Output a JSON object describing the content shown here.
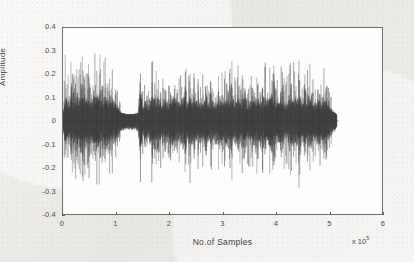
{
  "figure": {
    "name": "speech-waveform-plot",
    "background_color": "#ecebe7",
    "plot_area_color": "#fdfdfc",
    "axis_color": "#6f6f6f",
    "signal_color": "#3a3a3a"
  },
  "chart_data": {
    "type": "line",
    "title": "",
    "subtitle": "",
    "xlabel": "No.of Samples",
    "ylabel": "Amplitude",
    "x_multiplier_label": "x 10",
    "x_multiplier_exponent": "5",
    "xlim": [
      0,
      6
    ],
    "ylim": [
      -0.4,
      0.4
    ],
    "xticks": [
      0,
      1,
      2,
      3,
      4,
      5,
      6
    ],
    "xticklabels": [
      "0",
      "1",
      "2",
      "3",
      "4",
      "5",
      "6"
    ],
    "yticks": [
      0.4,
      0.3,
      0.2,
      0.1,
      0,
      -0.1,
      -0.2,
      -0.3,
      -0.4
    ],
    "yticklabels": [
      "0.4",
      "0.3",
      "0.2",
      "0.1",
      "0",
      "-0.1",
      "-0.2",
      "-0.3",
      "-0.4"
    ],
    "grid": false,
    "legend": null,
    "series_name": "audio amplitude",
    "signal_start_x": 0.0,
    "signal_end_x": 5.15,
    "max_positive_peak": 0.37,
    "max_negative_peak": -0.38,
    "noise_floor_band": 0.03,
    "envelope": [
      {
        "x": 0.0,
        "amp": 0.05
      },
      {
        "x": 0.05,
        "amp": 0.34
      },
      {
        "x": 0.1,
        "amp": 0.22
      },
      {
        "x": 0.15,
        "amp": 0.3
      },
      {
        "x": 0.2,
        "amp": 0.2
      },
      {
        "x": 0.26,
        "amp": 0.33
      },
      {
        "x": 0.32,
        "amp": 0.24
      },
      {
        "x": 0.38,
        "amp": 0.31
      },
      {
        "x": 0.44,
        "amp": 0.21
      },
      {
        "x": 0.5,
        "amp": 0.27
      },
      {
        "x": 0.56,
        "amp": 0.23
      },
      {
        "x": 0.62,
        "amp": 0.32
      },
      {
        "x": 0.68,
        "amp": 0.3
      },
      {
        "x": 0.74,
        "amp": 0.25
      },
      {
        "x": 0.8,
        "amp": 0.28
      },
      {
        "x": 0.86,
        "amp": 0.22
      },
      {
        "x": 0.92,
        "amp": 0.26
      },
      {
        "x": 0.98,
        "amp": 0.18
      },
      {
        "x": 1.04,
        "amp": 0.12
      },
      {
        "x": 1.1,
        "amp": 0.05
      },
      {
        "x": 1.18,
        "amp": 0.03
      },
      {
        "x": 1.26,
        "amp": 0.025
      },
      {
        "x": 1.34,
        "amp": 0.03
      },
      {
        "x": 1.42,
        "amp": 0.05
      },
      {
        "x": 1.45,
        "amp": 0.37
      },
      {
        "x": 1.5,
        "amp": 0.16
      },
      {
        "x": 1.56,
        "amp": 0.22
      },
      {
        "x": 1.62,
        "amp": 0.14
      },
      {
        "x": 1.68,
        "amp": 0.3
      },
      {
        "x": 1.74,
        "amp": 0.21
      },
      {
        "x": 1.8,
        "amp": 0.28
      },
      {
        "x": 1.86,
        "amp": 0.17
      },
      {
        "x": 1.92,
        "amp": 0.24
      },
      {
        "x": 1.98,
        "amp": 0.15
      },
      {
        "x": 2.04,
        "amp": 0.2
      },
      {
        "x": 2.1,
        "amp": 0.29
      },
      {
        "x": 2.16,
        "amp": 0.18
      },
      {
        "x": 2.22,
        "amp": 0.23
      },
      {
        "x": 2.28,
        "amp": 0.27
      },
      {
        "x": 2.34,
        "amp": 0.19
      },
      {
        "x": 2.4,
        "amp": 0.32
      },
      {
        "x": 2.46,
        "amp": 0.21
      },
      {
        "x": 2.52,
        "amp": 0.25
      },
      {
        "x": 2.58,
        "amp": 0.17
      },
      {
        "x": 2.64,
        "amp": 0.22
      },
      {
        "x": 2.7,
        "amp": 0.28
      },
      {
        "x": 2.76,
        "amp": 0.19
      },
      {
        "x": 2.82,
        "amp": 0.24
      },
      {
        "x": 2.88,
        "amp": 0.16
      },
      {
        "x": 2.94,
        "amp": 0.26
      },
      {
        "x": 3.0,
        "amp": 0.3
      },
      {
        "x": 3.06,
        "amp": 0.2
      },
      {
        "x": 3.12,
        "amp": 0.23
      },
      {
        "x": 3.18,
        "amp": 0.27
      },
      {
        "x": 3.24,
        "amp": 0.18
      },
      {
        "x": 3.3,
        "amp": 0.25
      },
      {
        "x": 3.36,
        "amp": 0.21
      },
      {
        "x": 3.42,
        "amp": 0.29
      },
      {
        "x": 3.48,
        "amp": 0.19
      },
      {
        "x": 3.54,
        "amp": 0.24
      },
      {
        "x": 3.6,
        "amp": 0.22
      },
      {
        "x": 3.66,
        "amp": 0.26
      },
      {
        "x": 3.72,
        "amp": 0.2
      },
      {
        "x": 3.78,
        "amp": 0.28
      },
      {
        "x": 3.84,
        "amp": 0.23
      },
      {
        "x": 3.9,
        "amp": 0.25
      },
      {
        "x": 3.96,
        "amp": 0.31
      },
      {
        "x": 4.02,
        "amp": 0.18
      },
      {
        "x": 4.08,
        "amp": 0.22
      },
      {
        "x": 4.14,
        "amp": 0.26
      },
      {
        "x": 4.2,
        "amp": 0.2
      },
      {
        "x": 4.26,
        "amp": 0.24
      },
      {
        "x": 4.32,
        "amp": 0.29
      },
      {
        "x": 4.38,
        "amp": 0.22
      },
      {
        "x": 4.44,
        "amp": 0.31
      },
      {
        "x": 4.5,
        "amp": 0.19
      },
      {
        "x": 4.56,
        "amp": 0.23
      },
      {
        "x": 4.62,
        "amp": 0.3
      },
      {
        "x": 4.68,
        "amp": 0.21
      },
      {
        "x": 4.74,
        "amp": 0.17
      },
      {
        "x": 4.8,
        "amp": 0.22
      },
      {
        "x": 4.86,
        "amp": 0.19
      },
      {
        "x": 4.92,
        "amp": 0.24
      },
      {
        "x": 4.98,
        "amp": 0.16
      },
      {
        "x": 5.04,
        "amp": 0.11
      },
      {
        "x": 5.1,
        "amp": 0.06
      },
      {
        "x": 5.15,
        "amp": 0.02
      }
    ]
  }
}
